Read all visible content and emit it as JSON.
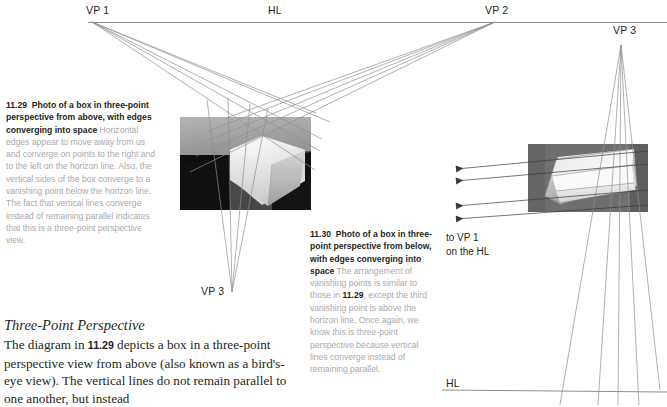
{
  "page": {
    "width": 667,
    "height": 405,
    "background": "#ffffff",
    "ink": "#231f20",
    "muted_text": "#a9a9ab",
    "line_color": "#8f8f92"
  },
  "labels": {
    "vp1_left": "VP 1",
    "hl_top": "HL",
    "vp2_top": "VP 2",
    "vp3_left_bottom": "VP 3",
    "vp3_right_top": "VP 3",
    "hl_bottom_right": "HL",
    "to_vp1_note": "to VP 1\non the HL"
  },
  "captions": {
    "fig1129": {
      "number": "11.29",
      "title": "Photo of a box in three-point perspective from above, with edges converging into space",
      "body": "Horizontal edges appear to move away from us and converge on points to the right and to the left on the horizon line. Also, the vertical sides of the box converge to a vanishing point below the horizon line. The fact that vertical lines converge instead of remaining parallel indicates that this is a three-point perspective view."
    },
    "fig1130": {
      "number": "11.30",
      "title": "Photo of a box in three-point perspective from below, with edges converging into space",
      "body_part1": "The arrangement of vanishing points is similar to those in ",
      "body_ref": "11.29",
      "body_part2": ", except the third vanishing point is above the horizon line. Once again, we know this is three-point perspective because vertical lines converge instead of remaining parallel."
    }
  },
  "section": {
    "heading": "Three-Point Perspective",
    "text_part1": "The diagram in ",
    "text_ref": "11.29",
    "text_part2": " depicts a box in a three-point perspective view from above (also known as a bird's-eye view). The vertical lines do not remain parallel to one another, but instead"
  },
  "figures": {
    "photo_above": {
      "name": "photo-box-from-above",
      "x": 180,
      "y": 117,
      "width": 131,
      "height": 93
    },
    "photo_below": {
      "name": "photo-box-from-below",
      "x": 528,
      "y": 144,
      "width": 120,
      "height": 68
    }
  },
  "geometry": {
    "vp1": {
      "x": 92,
      "y": 22
    },
    "vp2": {
      "x": 495,
      "y": 22
    },
    "vp3_left": {
      "x": 232,
      "y": 292
    },
    "vp3_right": {
      "x": 621,
      "y": 45
    },
    "hl_top": {
      "x1": 88,
      "y1": 22,
      "x2": 667,
      "y2": 22
    },
    "hl_bottom": {
      "x1": 442,
      "y1": 390,
      "x2": 667,
      "y2": 392
    }
  }
}
